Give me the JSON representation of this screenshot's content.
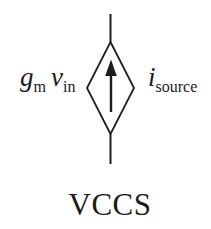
{
  "figure": {
    "caption": "VCCS",
    "left_label": {
      "var1": "g",
      "sub1": "m",
      "var2": "v",
      "sub2": "in"
    },
    "right_label": {
      "var": "i",
      "sub": "source"
    },
    "icons": [
      "current-source-diamond-icon",
      "up-arrow-icon"
    ],
    "colors": {
      "line": "#1f1f1f",
      "text": "#1a1a1a",
      "background": "#ffffff"
    }
  }
}
